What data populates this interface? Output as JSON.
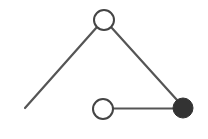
{
  "diagram": {
    "type": "graph",
    "colors": {
      "edge": "#555555",
      "node_stroke": "#444444",
      "node_fill_empty": "#ffffff",
      "node_fill_filled": "#333333",
      "background": "#ffffff"
    },
    "nodes": [
      {
        "id": "top",
        "x": 104,
        "y": 20,
        "r": 10,
        "filled": false
      },
      {
        "id": "bottom-middle",
        "x": 103,
        "y": 109,
        "r": 10,
        "filled": false
      },
      {
        "id": "bottom-right",
        "x": 183,
        "y": 108,
        "r": 10,
        "filled": true
      }
    ],
    "edges": [
      {
        "from": "top",
        "to_point": [
          25,
          108
        ]
      },
      {
        "from": "top",
        "to": "bottom-right"
      },
      {
        "from": "bottom-middle",
        "to": "bottom-right"
      }
    ]
  }
}
